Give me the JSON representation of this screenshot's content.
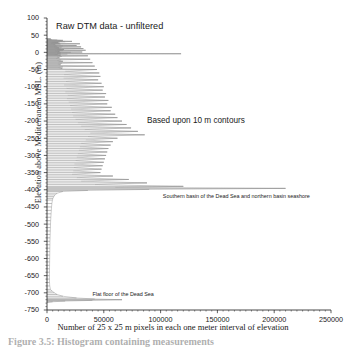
{
  "figure": {
    "caption": "Figure 3.5: Histogram containing measurements",
    "background": "#ffffff",
    "line_color": "#8c8c8c",
    "axis_color": "#1a1a1a"
  },
  "chart_data": {
    "type": "line",
    "title": "Raw DTM data - unfiltered",
    "xlabel": "Number of 25 x 25 m pixels in each one meter interval of elevation",
    "ylabel": "Elevation above Mediterranean MSL. (m)",
    "orientation": "horizontal-spikes",
    "grid": false,
    "legend": null,
    "xlim": [
      0,
      250000
    ],
    "ylim": [
      -750,
      100
    ],
    "xticks": [
      0,
      50000,
      100000,
      150000,
      200000,
      250000
    ],
    "xtick_labels": [
      "0",
      "50000",
      "100000",
      "150000",
      "200000",
      "250000"
    ],
    "yticks": [
      100,
      50,
      0,
      -50,
      -100,
      -150,
      -200,
      -250,
      -300,
      -350,
      -400,
      -450,
      -500,
      -550,
      -600,
      -650,
      -700,
      -750
    ],
    "ytick_labels": [
      "100",
      "50",
      "0",
      "-50",
      "-100",
      "-150",
      "-200",
      "-250",
      "-300",
      "-350",
      "-400",
      "-450",
      "-500",
      "-550",
      "-600",
      "-650",
      "-700",
      "-750"
    ],
    "annotations": [
      {
        "name": "title-annotation",
        "text": "Raw DTM data - unfiltered",
        "x": 8000,
        "y": 88
      },
      {
        "name": "contours-annotation",
        "text": "Based upon 10 m contours",
        "x": 88000,
        "y": -188
      },
      {
        "name": "southern-basin-annotation",
        "text": "Southern basin of the Dead Sea and northern basin seashore",
        "x": 102000,
        "y": -412
      },
      {
        "name": "flat-floor-annotation",
        "text": "Flat floor of the Dead Sea",
        "x": 40000,
        "y": -698
      }
    ],
    "series": [
      {
        "name": "Pixel count per 1 m elevation interval",
        "xlabel": "count",
        "ylabel": "elevation",
        "points": [
          [
            40,
            2400
          ],
          [
            39,
            3400
          ],
          [
            38,
            1800
          ],
          [
            37,
            4200
          ],
          [
            36,
            9000
          ],
          [
            35,
            14000
          ],
          [
            34,
            13000
          ],
          [
            33,
            9500
          ],
          [
            32,
            22000
          ],
          [
            31,
            16000
          ],
          [
            30,
            5200
          ],
          [
            29,
            9800
          ],
          [
            28,
            4200
          ],
          [
            27,
            11000
          ],
          [
            26,
            3200
          ],
          [
            25,
            29000
          ],
          [
            24,
            12000
          ],
          [
            23,
            7000
          ],
          [
            22,
            5200
          ],
          [
            21,
            8000
          ],
          [
            20,
            26000
          ],
          [
            19,
            14000
          ],
          [
            18,
            9000
          ],
          [
            17,
            6000
          ],
          [
            16,
            30000
          ],
          [
            15,
            13000
          ],
          [
            14,
            9200
          ],
          [
            13,
            10500
          ],
          [
            12,
            7000
          ],
          [
            11,
            32000
          ],
          [
            10,
            12000
          ],
          [
            9,
            8500
          ],
          [
            8,
            15000
          ],
          [
            7,
            9000
          ],
          [
            6,
            34000
          ],
          [
            5,
            14000
          ],
          [
            4,
            7500
          ],
          [
            3,
            11000
          ],
          [
            2,
            9500
          ],
          [
            1,
            31000
          ],
          [
            0,
            21000
          ],
          [
            -1,
            8500
          ],
          [
            -2,
            12000
          ],
          [
            -3,
            9000
          ],
          [
            -4,
            118000
          ],
          [
            -5,
            18000
          ],
          [
            -6,
            9500
          ],
          [
            -7,
            7000
          ],
          [
            -8,
            12000
          ],
          [
            -9,
            10000
          ],
          [
            -10,
            36000
          ],
          [
            -12,
            13000
          ],
          [
            -14,
            9000
          ],
          [
            -16,
            11000
          ],
          [
            -18,
            8000
          ],
          [
            -20,
            38000
          ],
          [
            -22,
            12500
          ],
          [
            -24,
            9000
          ],
          [
            -26,
            14000
          ],
          [
            -28,
            10000
          ],
          [
            -30,
            40000
          ],
          [
            -32,
            13000
          ],
          [
            -34,
            9500
          ],
          [
            -36,
            12000
          ],
          [
            -38,
            11000
          ],
          [
            -40,
            42000
          ],
          [
            -42,
            14000
          ],
          [
            -44,
            10000
          ],
          [
            -46,
            13500
          ],
          [
            -48,
            12000
          ],
          [
            -50,
            44000
          ],
          [
            -55,
            16000
          ],
          [
            -60,
            46000
          ],
          [
            -65,
            15000
          ],
          [
            -70,
            47000
          ],
          [
            -75,
            14500
          ],
          [
            -80,
            45000
          ],
          [
            -85,
            16500
          ],
          [
            -90,
            48000
          ],
          [
            -95,
            15000
          ],
          [
            -100,
            50000
          ],
          [
            -105,
            17000
          ],
          [
            -110,
            49000
          ],
          [
            -115,
            16000
          ],
          [
            -120,
            52000
          ],
          [
            -125,
            18000
          ],
          [
            -130,
            51000
          ],
          [
            -135,
            17500
          ],
          [
            -140,
            54000
          ],
          [
            -145,
            19000
          ],
          [
            -150,
            53000
          ],
          [
            -155,
            20000
          ],
          [
            -160,
            57000
          ],
          [
            -165,
            21000
          ],
          [
            -170,
            56000
          ],
          [
            -175,
            22000
          ],
          [
            -180,
            60000
          ],
          [
            -185,
            23000
          ],
          [
            -190,
            62000
          ],
          [
            -195,
            25000
          ],
          [
            -200,
            66000
          ],
          [
            -205,
            27000
          ],
          [
            -210,
            70000
          ],
          [
            -215,
            30000
          ],
          [
            -220,
            74000
          ],
          [
            -225,
            33000
          ],
          [
            -230,
            80000
          ],
          [
            -235,
            38000
          ],
          [
            -240,
            86000
          ],
          [
            -245,
            36000
          ],
          [
            -250,
            62000
          ],
          [
            -255,
            34000
          ],
          [
            -260,
            58000
          ],
          [
            -265,
            30000
          ],
          [
            -270,
            56000
          ],
          [
            -275,
            29000
          ],
          [
            -280,
            54000
          ],
          [
            -285,
            28000
          ],
          [
            -290,
            53000
          ],
          [
            -295,
            27000
          ],
          [
            -300,
            52000
          ],
          [
            -305,
            26000
          ],
          [
            -310,
            51000
          ],
          [
            -315,
            25000
          ],
          [
            -320,
            50000
          ],
          [
            -325,
            24000
          ],
          [
            -330,
            49000
          ],
          [
            -335,
            23500
          ],
          [
            -340,
            48000
          ],
          [
            -345,
            23000
          ],
          [
            -350,
            47000
          ],
          [
            -355,
            22000
          ],
          [
            -360,
            58000
          ],
          [
            -365,
            26000
          ],
          [
            -370,
            72000
          ],
          [
            -375,
            30000
          ],
          [
            -380,
            88000
          ],
          [
            -385,
            42000
          ],
          [
            -390,
            120000
          ],
          [
            -393,
            60000
          ],
          [
            -396,
            210000
          ],
          [
            -399,
            90000
          ],
          [
            -402,
            36000
          ],
          [
            -405,
            14000
          ],
          [
            -410,
            9000
          ],
          [
            -415,
            7000
          ],
          [
            -420,
            6000
          ],
          [
            -425,
            5200
          ],
          [
            -430,
            4800
          ],
          [
            -440,
            4300
          ],
          [
            -450,
            4000
          ],
          [
            -460,
            3800
          ],
          [
            -470,
            3600
          ],
          [
            -480,
            3400
          ],
          [
            -490,
            3200
          ],
          [
            -500,
            3100
          ],
          [
            -510,
            3000
          ],
          [
            -520,
            2900
          ],
          [
            -530,
            2800
          ],
          [
            -540,
            2700
          ],
          [
            -550,
            2600
          ],
          [
            -560,
            2550
          ],
          [
            -570,
            2500
          ],
          [
            -580,
            2450
          ],
          [
            -590,
            2400
          ],
          [
            -600,
            2350
          ],
          [
            -610,
            2300
          ],
          [
            -620,
            2250
          ],
          [
            -630,
            2200
          ],
          [
            -640,
            2200
          ],
          [
            -650,
            2150
          ],
          [
            -660,
            2150
          ],
          [
            -670,
            2200
          ],
          [
            -680,
            2400
          ],
          [
            -690,
            3000
          ],
          [
            -695,
            4500
          ],
          [
            -700,
            6500
          ],
          [
            -705,
            9000
          ],
          [
            -710,
            14000
          ],
          [
            -715,
            26000
          ],
          [
            -718,
            42000
          ],
          [
            -720,
            66000
          ],
          [
            -722,
            40000
          ],
          [
            -724,
            16000
          ],
          [
            -726,
            5000
          ],
          [
            -728,
            1500
          ]
        ]
      }
    ]
  }
}
